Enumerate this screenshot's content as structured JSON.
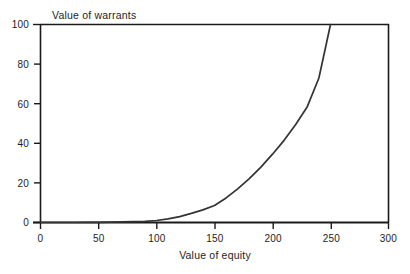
{
  "chart_data": {
    "type": "line",
    "title": "",
    "xlabel": "Value of equity",
    "ylabel": "Value of warrants",
    "xlim": [
      0,
      300
    ],
    "ylim": [
      0,
      100
    ],
    "xticks": [
      0,
      50,
      100,
      150,
      200,
      250,
      300
    ],
    "yticks": [
      0,
      20,
      40,
      60,
      80,
      100
    ],
    "grid": false,
    "legend": null,
    "series": [
      {
        "name": "Value of warrants",
        "color": "#333333",
        "x": [
          0,
          10,
          20,
          30,
          40,
          50,
          60,
          70,
          80,
          90,
          100,
          110,
          120,
          130,
          140,
          150,
          160,
          170,
          180,
          190,
          200,
          210,
          220,
          230,
          240,
          250
        ],
        "y": [
          0,
          0,
          0,
          0,
          0.1,
          0.1,
          0.2,
          0.3,
          0.4,
          0.6,
          1.0,
          1.8,
          3.0,
          4.6,
          6.4,
          8.6,
          12.4,
          17.0,
          22.2,
          28.0,
          34.5,
          41.5,
          49.5,
          58.5,
          73.0,
          100.0
        ]
      }
    ]
  },
  "axes": {
    "x_tick_labels": [
      "0",
      "50",
      "100",
      "150",
      "200",
      "250",
      "300"
    ],
    "y_tick_labels": [
      "0",
      "20",
      "40",
      "60",
      "80",
      "100"
    ],
    "x_title": "Value of equity",
    "y_title": "Value of warrants"
  },
  "colors": {
    "curve": "#333333",
    "axis": "#1a1a1a",
    "background": "#ffffff",
    "text": "#1d1d1d"
  }
}
